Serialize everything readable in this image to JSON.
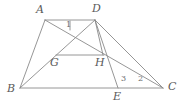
{
  "figure": {
    "background_color": "#ffffff",
    "stroke_color": "#8a8a8a",
    "label_color": "#5a5a5a",
    "stroke_width": 0.9,
    "width": 182,
    "height": 107
  },
  "points": [
    {
      "name": "A",
      "label": "A",
      "x": 45,
      "y": 20,
      "label_x": 36,
      "label_y": 7
    },
    {
      "name": "D",
      "label": "D",
      "x": 95,
      "y": 20,
      "label_x": 93,
      "label_y": 6
    },
    {
      "name": "B",
      "label": "B",
      "x": 20,
      "y": 88,
      "label_x": 8,
      "label_y": 83
    },
    {
      "name": "C",
      "label": "C",
      "x": 163,
      "y": 88,
      "label_x": 168,
      "label_y": 82
    },
    {
      "name": "E",
      "label": "E",
      "x": 118,
      "y": 88,
      "label_x": 113,
      "label_y": 92
    },
    {
      "name": "G",
      "label": "G",
      "x": 57,
      "y": 55,
      "label_x": 51,
      "label_y": 57
    },
    {
      "name": "H",
      "label": "H",
      "x": 103,
      "y": 55,
      "label_x": 96,
      "label_y": 57
    }
  ],
  "segments": [
    {
      "name": "segment-AD",
      "from": "A",
      "to": "D"
    },
    {
      "name": "segment-AB",
      "from": "A",
      "to": "B"
    },
    {
      "name": "segment-BC",
      "from": "B",
      "to": "C"
    },
    {
      "name": "segment-DC",
      "from": "D",
      "to": "C"
    },
    {
      "name": "segment-BD",
      "from": "B",
      "to": "D"
    },
    {
      "name": "segment-AC",
      "from": "A",
      "to": "C"
    },
    {
      "name": "segment-GH",
      "from": "G",
      "to": "H"
    },
    {
      "name": "segment-DE",
      "from": "D",
      "to": "E"
    },
    {
      "name": "segment-DH",
      "from": "D",
      "to": "H"
    }
  ],
  "angle_marks": [
    {
      "name": "angle-1",
      "label": "1",
      "x": 68,
      "y": 22,
      "tick_x": 70,
      "tick_y1": 21,
      "tick_y2": 30
    },
    {
      "name": "angle-3",
      "label": "3",
      "x": 122,
      "y": 76
    },
    {
      "name": "angle-2",
      "label": "2",
      "x": 139,
      "y": 76
    }
  ]
}
